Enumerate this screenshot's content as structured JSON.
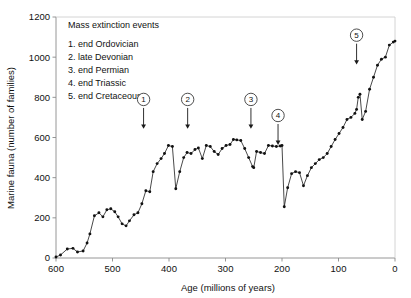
{
  "chart_data": {
    "type": "line",
    "title": "",
    "xlabel": "Age (millions of years)",
    "ylabel": "Marine fauna (number of families)",
    "xlim": [
      600,
      0
    ],
    "ylim": [
      0,
      1200
    ],
    "x_reversed": true,
    "grid": false,
    "legend_position": "top-left-inside",
    "xticks": [
      600,
      500,
      400,
      300,
      200,
      100,
      0
    ],
    "yticks": [
      0,
      200,
      400,
      600,
      800,
      1000,
      1200
    ],
    "xtick_labels": [
      "600",
      "500",
      "400",
      "300",
      "200",
      "100",
      "0"
    ],
    "ytick_labels": [
      "0",
      "200",
      "400",
      "600",
      "800",
      "1000",
      "1200"
    ],
    "marker_style": "filled-circle",
    "series": [
      {
        "name": "Marine fauna diversity",
        "x": [
          600,
          592,
          580,
          570,
          562,
          552,
          545,
          540,
          532,
          524,
          517,
          510,
          503,
          496,
          490,
          483,
          476,
          470,
          462,
          455,
          448,
          441,
          434,
          428,
          421,
          414,
          408,
          401,
          394,
          388,
          381,
          374,
          368,
          361,
          354,
          348,
          341,
          334,
          327,
          320,
          313,
          306,
          299,
          292,
          286,
          280,
          273,
          266,
          259,
          252,
          250,
          245,
          238,
          231,
          224,
          217,
          210,
          203,
          200,
          196,
          190,
          183,
          176,
          169,
          162,
          155,
          148,
          141,
          134,
          127,
          120,
          113,
          106,
          99,
          92,
          85,
          78,
          71,
          68,
          65,
          62,
          58,
          52,
          45,
          38,
          31,
          24,
          17,
          10,
          3,
          0
        ],
        "y": [
          5,
          15,
          45,
          48,
          30,
          35,
          75,
          120,
          210,
          225,
          205,
          240,
          245,
          230,
          205,
          170,
          160,
          185,
          215,
          225,
          270,
          335,
          330,
          430,
          470,
          495,
          520,
          560,
          555,
          345,
          430,
          500,
          525,
          520,
          540,
          548,
          495,
          560,
          555,
          530,
          515,
          545,
          560,
          565,
          590,
          588,
          585,
          545,
          500,
          455,
          450,
          530,
          525,
          520,
          560,
          558,
          555,
          558,
          560,
          255,
          350,
          420,
          430,
          425,
          360,
          410,
          450,
          470,
          490,
          500,
          520,
          555,
          590,
          620,
          650,
          690,
          700,
          720,
          740,
          800,
          815,
          690,
          730,
          840,
          900,
          960,
          990,
          1000,
          1060,
          1075,
          1080
        ]
      }
    ],
    "annotations": [
      {
        "id": "1",
        "label": "end Ordovician",
        "x": 445,
        "arrow_to_y": 680
      },
      {
        "id": "2",
        "label": "late Devonian",
        "x": 367,
        "arrow_to_y": 680
      },
      {
        "id": "3",
        "label": "end Permian",
        "x": 255,
        "arrow_to_y": 680
      },
      {
        "id": "4",
        "label": "end Triassic",
        "x": 207,
        "arrow_to_y": 600
      },
      {
        "id": "5",
        "label": "end Cretaceous",
        "x": 68,
        "arrow_to_y": 1000
      }
    ]
  },
  "legend": {
    "heading": "Mass extinction events",
    "entries": [
      {
        "number": "1.",
        "label": "end Ordovician"
      },
      {
        "number": "2.",
        "label": "late Devonian"
      },
      {
        "number": "3.",
        "label": "end Permian"
      },
      {
        "number": "4.",
        "label": "end Triassic"
      },
      {
        "number": "5.",
        "label": "end Cretaceous"
      }
    ]
  },
  "markers": {
    "m1": "1",
    "m2": "2",
    "m3": "3",
    "m4": "4",
    "m5": "5"
  },
  "axes": {
    "y_label": "Marine fauna (number of families)",
    "x_label": "Age (millions of years)",
    "y_ticks": [
      "1200",
      "1000",
      "800",
      "600",
      "400",
      "200",
      "0"
    ],
    "x_ticks": [
      "600",
      "500",
      "400",
      "300",
      "200",
      "100",
      "0"
    ]
  },
  "colors": {
    "line": "#1a1a1a",
    "marker": "#111111",
    "axis": "#6b6b6b",
    "text": "#111111",
    "background": "#ffffff"
  }
}
